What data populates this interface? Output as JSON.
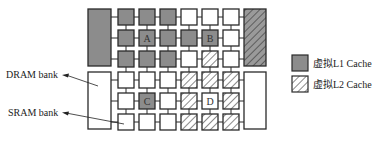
{
  "colors": {
    "l1_fill": "#8c8c8c",
    "empty_fill": "#ffffff",
    "stroke": "#2a2a2a",
    "hatch": "#2a2a2a",
    "hatch_bg": "#ffffff",
    "hatch_bank_bg": "#9a9a9a"
  },
  "labels": {
    "dram_bank": "DRAM bank",
    "sram_bank": "SRAM bank"
  },
  "legend": [
    {
      "key": "l1",
      "label": "虚拟L1 Cache",
      "pattern": "solid-gray"
    },
    {
      "key": "l2",
      "label": "虚拟L2 Cache",
      "pattern": "hatched"
    }
  ],
  "grid": {
    "rows": 6,
    "cols": 6,
    "cells": [
      [
        "l1",
        "l1",
        "l1",
        "empty",
        "empty",
        "empty"
      ],
      [
        "l1",
        "l1",
        "l1",
        "l1",
        "l1",
        "empty"
      ],
      [
        "l1",
        "l1",
        "l1",
        "empty",
        "l2",
        "empty"
      ],
      [
        "empty",
        "empty",
        "empty",
        "l2",
        "l2",
        "l2"
      ],
      [
        "empty",
        "l1",
        "empty",
        "l2",
        "empty",
        "l2"
      ],
      [
        "empty",
        "empty",
        "empty",
        "l2",
        "l2",
        "l2"
      ]
    ],
    "marked_cells": [
      {
        "row": 1,
        "col": 1,
        "text": "A"
      },
      {
        "row": 1,
        "col": 4,
        "text": "B"
      },
      {
        "row": 4,
        "col": 1,
        "text": "C"
      },
      {
        "row": 4,
        "col": 4,
        "text": "D"
      }
    ]
  },
  "dram_banks": [
    {
      "side": "left",
      "position": "top",
      "type": "l1"
    },
    {
      "side": "left",
      "position": "bottom",
      "type": "empty"
    },
    {
      "side": "right",
      "position": "top",
      "type": "l2"
    },
    {
      "side": "right",
      "position": "bottom",
      "type": "empty"
    }
  ]
}
